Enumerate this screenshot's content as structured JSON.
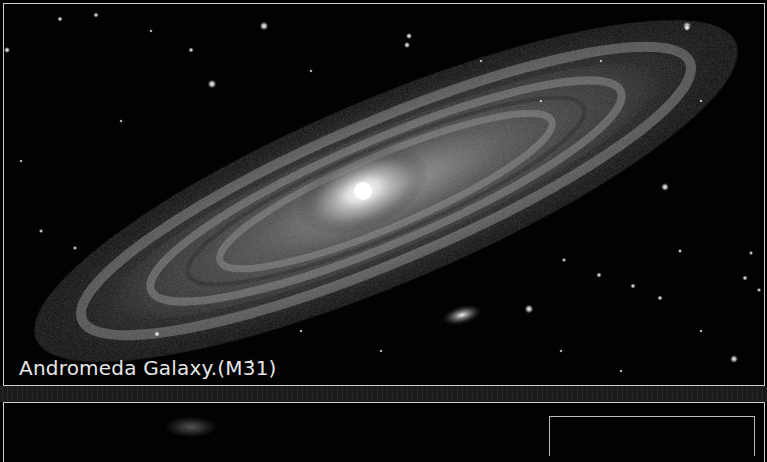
{
  "image": {
    "subject": "Andromeda Galaxy spiral galaxy photograph with satellite galaxy and foreground stars",
    "caption": "Andromeda Galaxy.(M31)",
    "colors": {
      "background": "#000000",
      "border": "#cfcfcf",
      "caption_text": "#e6e6e6",
      "galaxy_core": "#ffffff",
      "separator_band": "#222222"
    }
  },
  "panels": [
    {
      "name": "galaxy-photo",
      "caption": "Andromeda Galaxy.(M31)"
    },
    {
      "name": "lower-photo",
      "has_inner_box": true
    }
  ]
}
